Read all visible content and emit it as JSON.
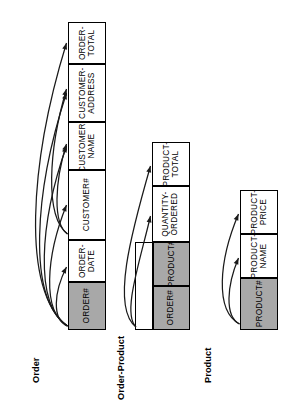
{
  "diagram": {
    "orientation": "rotated-90-ccw",
    "colors": {
      "key_fill": "#a8a8a8",
      "cell_fill": "#ffffff",
      "stroke": "#000000",
      "arrow": "#1a1a1a",
      "background": "#ffffff"
    }
  },
  "entities": [
    {
      "name": "Order",
      "label": "Order",
      "attributes": [
        {
          "label": "ORDER#",
          "lines": [
            "ORDER#"
          ],
          "key": true
        },
        {
          "label": "ORDER-DATE",
          "lines": [
            "ORDER-",
            "DATE"
          ],
          "key": false
        },
        {
          "label": "CUSTOMER#",
          "lines": [
            "CUSTOMER#"
          ],
          "key": false
        },
        {
          "label": "CUSTOMER-NAME",
          "lines": [
            "CUSTOMER-",
            "NAME"
          ],
          "key": false
        },
        {
          "label": "CUSTOMER-ADDRESS",
          "lines": [
            "CUSTOMER-",
            "ADDRESS"
          ],
          "key": false
        },
        {
          "label": "ORDER-TOTAL",
          "lines": [
            "ORDER-",
            "TOTAL"
          ],
          "key": false
        }
      ],
      "dependencies": [
        {
          "from": "ORDER#",
          "to": "ORDER-DATE"
        },
        {
          "from": "ORDER#",
          "to": "CUSTOMER#"
        },
        {
          "from": "ORDER#",
          "to": "CUSTOMER-NAME"
        },
        {
          "from": "ORDER#",
          "to": "CUSTOMER-ADDRESS"
        },
        {
          "from": "ORDER#",
          "to": "ORDER-TOTAL"
        },
        {
          "from": "CUSTOMER#",
          "to": "CUSTOMER-NAME"
        },
        {
          "from": "CUSTOMER#",
          "to": "CUSTOMER-ADDRESS"
        }
      ]
    },
    {
      "name": "Order-Product",
      "label": "Order-Product",
      "attributes": [
        {
          "label": "ORDER#",
          "lines": [
            "ORDER#"
          ],
          "key": true
        },
        {
          "label": "PRODUCT#",
          "lines": [
            "PRODUCT#"
          ],
          "key": true
        },
        {
          "label": "QUANTITY-ORDERED",
          "lines": [
            "QUANTITY-",
            "ORDERED"
          ],
          "key": false
        },
        {
          "label": "PRODUCT-TOTAL",
          "lines": [
            "PRODUCT-",
            "TOTAL"
          ],
          "key": false
        }
      ],
      "dependencies": [
        {
          "from": "ORDER#+PRODUCT#",
          "to": "QUANTITY-ORDERED"
        },
        {
          "from": "ORDER#+PRODUCT#",
          "to": "PRODUCT-TOTAL"
        }
      ]
    },
    {
      "name": "Product",
      "label": "Product",
      "attributes": [
        {
          "label": "PRODUCT#",
          "lines": [
            "PRODUCT#"
          ],
          "key": true
        },
        {
          "label": "PRODUCT-NAME",
          "lines": [
            "PRODUCT-",
            "NAME"
          ],
          "key": false
        },
        {
          "label": "PRODUCT-PRICE",
          "lines": [
            "PRODUCT-",
            "PRICE"
          ],
          "key": false
        }
      ],
      "dependencies": [
        {
          "from": "PRODUCT#",
          "to": "PRODUCT-NAME"
        },
        {
          "from": "PRODUCT#",
          "to": "PRODUCT-PRICE"
        }
      ]
    }
  ]
}
